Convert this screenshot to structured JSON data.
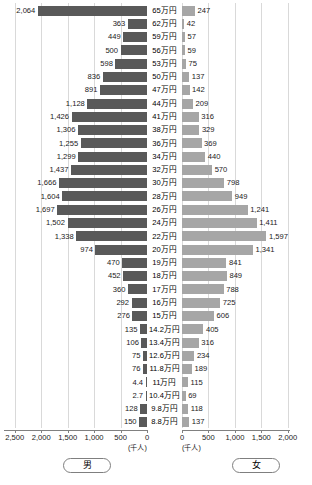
{
  "chart_data": {
    "type": "bar",
    "subtype": "population-pyramid",
    "title": "",
    "xlabel": "",
    "ylabel": "",
    "unit_label_left": "(千人)",
    "unit_label_right": "(千人)",
    "grid": true,
    "legend_position": "bottom",
    "categories": [
      "65万円",
      "62万円",
      "59万円",
      "56万円",
      "53万円",
      "50万円",
      "47万円",
      "44万円",
      "41万円",
      "38万円",
      "36万円",
      "34万円",
      "32万円",
      "30万円",
      "28万円",
      "26万円",
      "24万円",
      "22万円",
      "20万円",
      "19万円",
      "18万円",
      "17万円",
      "16万円",
      "15万円",
      "14.2万円",
      "13.4万円",
      "12.6万円",
      "11.8万円",
      "11万円",
      "10.4万円",
      "9.8万円",
      "8.8万円"
    ],
    "series": [
      {
        "name": "男",
        "direction": "left",
        "color": "#595959",
        "axis_max": 2500,
        "axis_ticks": [
          2500,
          2000,
          1500,
          1000,
          500,
          0
        ],
        "axis_tick_labels": [
          "2,500",
          "2,000",
          "1,500",
          "1,000",
          "500",
          "0"
        ],
        "values": [
          2064,
          363,
          449,
          500,
          598,
          836,
          891,
          1128,
          1426,
          1306,
          1255,
          1299,
          1437,
          1666,
          1604,
          1697,
          1502,
          1338,
          974,
          470,
          452,
          360,
          292,
          276,
          135,
          106,
          75,
          76,
          4.4,
          2.7,
          128,
          150
        ],
        "value_labels": [
          "2,064",
          "363",
          "449",
          "500",
          "598",
          "836",
          "891",
          "1,128",
          "1,426",
          "1,306",
          "1,255",
          "1,299",
          "1,437",
          "1,666",
          "1,604",
          "1,697",
          "1,502",
          "1,338",
          "974",
          "470",
          "452",
          "360",
          "292",
          "276",
          "135",
          "106",
          "75",
          "76",
          "4.4",
          "2.7",
          "128",
          "150"
        ]
      },
      {
        "name": "女",
        "direction": "right",
        "color": "#a6a6a6",
        "axis_max": 2000,
        "axis_ticks": [
          0,
          500,
          1000,
          1500,
          2000
        ],
        "axis_tick_labels": [
          "0",
          "500",
          "1,000",
          "1,500",
          "2,000"
        ],
        "values": [
          247,
          42,
          57,
          59,
          75,
          137,
          142,
          209,
          316,
          329,
          369,
          440,
          570,
          798,
          949,
          1241,
          1411,
          1597,
          1341,
          841,
          849,
          788,
          725,
          606,
          405,
          316,
          234,
          189,
          115,
          69,
          118,
          137
        ],
        "value_labels": [
          "247",
          "42",
          "57",
          "59",
          "75",
          "137",
          "142",
          "209",
          "316",
          "329",
          "369",
          "440",
          "570",
          "798",
          "949",
          "1,241",
          "1,411",
          "1,597",
          "1,341",
          "841",
          "849",
          "788",
          "725",
          "606",
          "405",
          "316",
          "234",
          "189",
          "115",
          "69",
          "118",
          "137"
        ]
      }
    ]
  },
  "legend": {
    "male": "男",
    "female": "女"
  },
  "footnote": ""
}
